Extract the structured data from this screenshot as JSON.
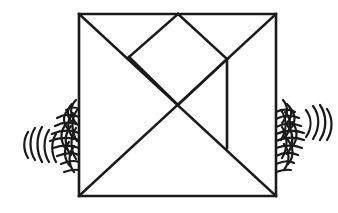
{
  "figure": {
    "background_color": "#ffffff",
    "ink_color": "#1a1a1a",
    "canvas": {
      "width": 338,
      "height": 213
    }
  },
  "square": {
    "name": "tangram-outline",
    "left": 79,
    "top": 14,
    "right": 276,
    "bottom": 196,
    "stroke_width": 2.6,
    "corners": {
      "top_left": [
        79,
        14
      ],
      "top_right": [
        276,
        14
      ],
      "bottom_right": [
        276,
        196
      ],
      "bottom_left": [
        79,
        196
      ]
    }
  },
  "vertices": {
    "top_left": [
      79,
      14
    ],
    "top_mid": [
      178,
      14
    ],
    "top_right": [
      276,
      14
    ],
    "left_diag_mid": [
      129,
      57
    ],
    "right_junction": [
      227,
      59
    ],
    "center": [
      178,
      105
    ],
    "right_vert_bottom": [
      227,
      148
    ],
    "bottom_left": [
      79,
      196
    ],
    "bottom_right": [
      276,
      196
    ]
  },
  "interior_lines": [
    {
      "name": "main-diagonal",
      "from": [
        79,
        14
      ],
      "to": [
        276,
        196
      ],
      "stroke_width": 2.6
    },
    {
      "name": "anti-diagonal",
      "from": [
        79,
        196
      ],
      "to": [
        276,
        14
      ],
      "stroke_width": 2.6
    },
    {
      "name": "top-mid-to-left-vertex",
      "from": [
        178,
        14
      ],
      "to": [
        129,
        57
      ],
      "stroke_width": 2.6
    },
    {
      "name": "top-mid-to-right-junction",
      "from": [
        178,
        14
      ],
      "to": [
        227,
        59
      ],
      "stroke_width": 2.6
    },
    {
      "name": "left-vertex-to-center",
      "from": [
        129,
        57
      ],
      "to": [
        178,
        105
      ],
      "stroke_width": 2.6
    },
    {
      "name": "center-to-right-junction",
      "from": [
        178,
        105
      ],
      "to": [
        227,
        59
      ],
      "stroke_width": 2.6
    },
    {
      "name": "right-vertical-divider",
      "from": [
        227,
        59
      ],
      "to": [
        227,
        148
      ],
      "stroke_width": 2.6
    }
  ],
  "pieces": {
    "count": 7,
    "labels": [
      "large-triangle-left",
      "large-triangle-bottom",
      "medium-triangle-right",
      "small-triangle-top",
      "small-triangle-center",
      "square-piece",
      "parallelogram-piece"
    ]
  },
  "motion_marks": {
    "left": {
      "name": "motion-scribble-left",
      "center": [
        52,
        138
      ],
      "attached_edge": "left",
      "stroke_color": "#1a1a1a"
    },
    "right": {
      "name": "motion-scribble-right",
      "center": [
        300,
        132
      ],
      "attached_edge": "right",
      "stroke_color": "#1a1a1a"
    }
  }
}
